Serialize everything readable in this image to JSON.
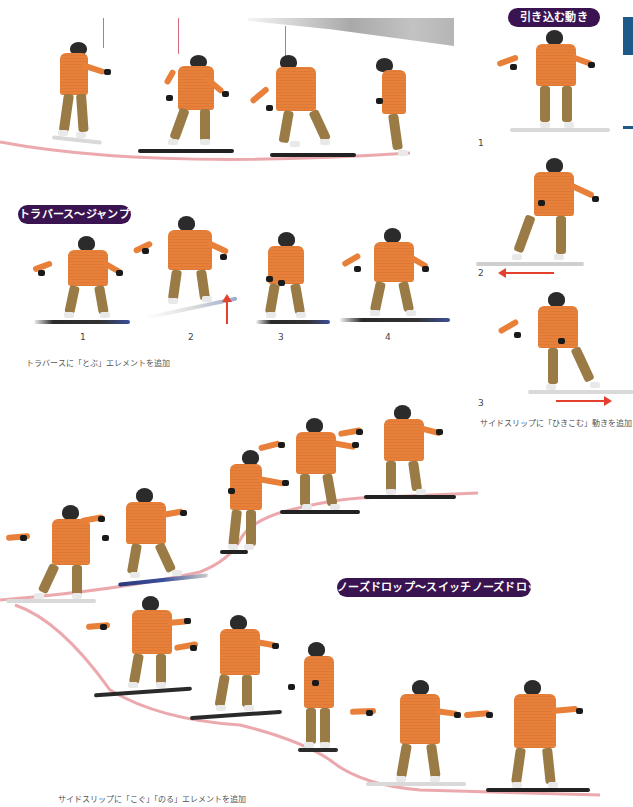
{
  "sections": {
    "pull_in": {
      "title": "引き込む動き",
      "steps": [
        "1",
        "2",
        "3"
      ],
      "caption": "サイドスリップに「ひきこむ」動きを追加"
    },
    "traverse_jump": {
      "title": "トラバース〜ジャンプ",
      "steps": [
        "1",
        "2",
        "3",
        "4"
      ],
      "caption": "トラバースに「とぶ」エレメントを追加"
    },
    "nose_drop": {
      "title": "ノーズドロップ〜スイッチノーズドロップ",
      "caption": "サイドスリップに「こぐ」「のる」エレメントを追加"
    }
  },
  "colors": {
    "badge": "#3a1450",
    "path": "#e89aa0",
    "arrow": "#e4402e",
    "jacket": "#e8803a",
    "pants": "#9a7b45",
    "accent_tab": "#1d5a8a"
  },
  "figures": {
    "top_sequence_count": 4,
    "traverse_jump_count": 4,
    "pull_in_count": 3,
    "upper_slope_count": 6,
    "lower_slope_count": 5
  }
}
